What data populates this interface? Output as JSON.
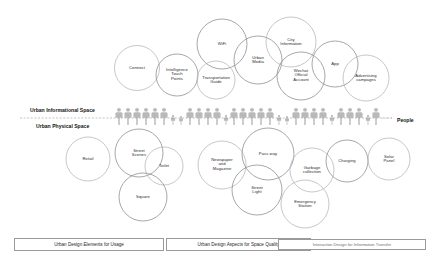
{
  "diagram": {
    "title_hidden": "",
    "spaces": [
      {
        "id": "informational",
        "label": "Urban Informational Space",
        "x": 30,
        "y": 110
      },
      {
        "id": "physical",
        "label": "Urban Physical Space",
        "x": 36,
        "y": 126
      }
    ],
    "people_label": {
      "label": "People",
      "x": 397,
      "y": 120
    },
    "divider": {
      "y": 118,
      "x1": 20,
      "x2": 392,
      "style": "dashed",
      "color": "#9a9a9a"
    },
    "colors": {
      "circle_stroke": "#b4b4b4",
      "circle_stroke_dark": "#8a8a8a",
      "people_fill": "#b9b9b9",
      "text": "#2b2b2b",
      "box_border": "#9a9a9a",
      "divider": "#9a9a9a",
      "background": "#ffffff"
    },
    "upper_circles": [
      {
        "name": "connect",
        "label": "Connect",
        "cx": 137,
        "cy": 68,
        "r": 22.5,
        "tone": "light"
      },
      {
        "name": "intelligence-touch-points",
        "label": "Intelligence\nTouch\nPoints",
        "cx": 177,
        "cy": 75,
        "r": 21,
        "tone": "dark"
      },
      {
        "name": "wifi",
        "label": "WiFi",
        "cx": 222,
        "cy": 44,
        "r": 25,
        "tone": "dark"
      },
      {
        "name": "transportation-guide",
        "label": "Transportation\nGuide",
        "cx": 216,
        "cy": 80,
        "r": 19,
        "tone": "light"
      },
      {
        "name": "urban-media",
        "label": "Urban\nMedia",
        "cx": 258,
        "cy": 60,
        "r": 24,
        "tone": "dark"
      },
      {
        "name": "city-information",
        "label": "City\nInformation",
        "cx": 291,
        "cy": 42,
        "r": 25,
        "tone": "light"
      },
      {
        "name": "wechat-official-account",
        "label": "Wechat\nOfficial\nAccount",
        "cx": 301,
        "cy": 76,
        "r": 24,
        "tone": "dark"
      },
      {
        "name": "app",
        "label": "App",
        "cx": 335,
        "cy": 64,
        "r": 23,
        "tone": "dark"
      },
      {
        "name": "advertising-campaigns",
        "label": "Advertising\ncampagns",
        "cx": 366,
        "cy": 78,
        "r": 23,
        "tone": "light"
      }
    ],
    "lower_circles": [
      {
        "name": "retail",
        "label": "Retail",
        "cx": 88,
        "cy": 159,
        "r": 22,
        "tone": "light"
      },
      {
        "name": "street-scenes",
        "label": "Street\nScenes",
        "cx": 139,
        "cy": 153,
        "r": 24,
        "tone": "dark"
      },
      {
        "name": "toilet",
        "label": "Toilet",
        "cx": 164,
        "cy": 166,
        "r": 19,
        "tone": "light"
      },
      {
        "name": "square",
        "label": "Square",
        "cx": 143,
        "cy": 197,
        "r": 24,
        "tone": "dark"
      },
      {
        "name": "newspaper-and-magazine",
        "label": "Newspaper\nand\nMagazine",
        "cx": 222,
        "cy": 165,
        "r": 24,
        "tone": "light"
      },
      {
        "name": "pass-way",
        "label": "Pass way",
        "cx": 268,
        "cy": 154,
        "r": 26,
        "tone": "dark"
      },
      {
        "name": "street-light",
        "label": "Street\nLight",
        "cx": 257,
        "cy": 190,
        "r": 25,
        "tone": "dark"
      },
      {
        "name": "garbage-collection",
        "label": "Garbage\ncollection",
        "cx": 312,
        "cy": 170,
        "r": 22,
        "tone": "light"
      },
      {
        "name": "emergency-station",
        "label": "Emergency\nStation",
        "cx": 305,
        "cy": 204,
        "r": 24,
        "tone": "light"
      },
      {
        "name": "charging",
        "label": "Charging",
        "cx": 347,
        "cy": 161,
        "r": 21,
        "tone": "dark"
      },
      {
        "name": "solar-panel",
        "label": "Solar\nPanel",
        "cx": 389,
        "cy": 159,
        "r": 21,
        "tone": "light"
      }
    ],
    "people_row": {
      "baseline_y": 125,
      "figures": [
        {
          "x": 119,
          "h": 17
        },
        {
          "x": 128,
          "h": 17
        },
        {
          "x": 137,
          "h": 17
        },
        {
          "x": 146,
          "h": 17
        },
        {
          "x": 155,
          "h": 17
        },
        {
          "x": 164,
          "h": 17
        },
        {
          "x": 173,
          "h": 10
        },
        {
          "x": 181,
          "h": 9
        },
        {
          "x": 190,
          "h": 17
        },
        {
          "x": 199,
          "h": 17
        },
        {
          "x": 208,
          "h": 17
        },
        {
          "x": 217,
          "h": 17
        },
        {
          "x": 226,
          "h": 10
        },
        {
          "x": 234,
          "h": 17
        },
        {
          "x": 243,
          "h": 17
        },
        {
          "x": 252,
          "h": 17
        },
        {
          "x": 261,
          "h": 17
        },
        {
          "x": 270,
          "h": 17
        },
        {
          "x": 279,
          "h": 10
        },
        {
          "x": 287,
          "h": 9
        },
        {
          "x": 296,
          "h": 17
        },
        {
          "x": 305,
          "h": 17
        },
        {
          "x": 314,
          "h": 17
        },
        {
          "x": 323,
          "h": 17
        },
        {
          "x": 332,
          "h": 10
        },
        {
          "x": 341,
          "h": 17
        },
        {
          "x": 350,
          "h": 17
        },
        {
          "x": 359,
          "h": 17
        },
        {
          "x": 368,
          "h": 10
        },
        {
          "x": 376,
          "h": 17
        }
      ]
    },
    "legend_boxes": [
      {
        "name": "legend-usage",
        "label": "Urban Design Elements for Usage",
        "x": 14,
        "y": 238,
        "w": 150,
        "h": 13,
        "muted": false
      },
      {
        "name": "legend-space-quality",
        "label": "Urban Design Aspects for Space Quality",
        "x": 166,
        "y": 238,
        "w": 145,
        "h": 13,
        "muted": false
      },
      {
        "name": "legend-information",
        "label": "Interaction Design for Information Transfer",
        "x": 278,
        "y": 239,
        "w": 148,
        "h": 11,
        "muted": true
      }
    ]
  }
}
